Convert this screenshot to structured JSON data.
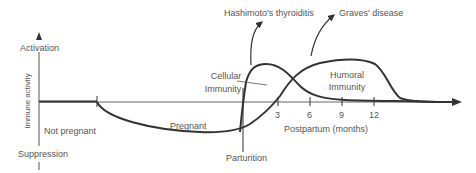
{
  "diagram": {
    "y_axis": {
      "label": "Immune activity",
      "top_label": "Activation",
      "bottom_label": "Suppression"
    },
    "x_axis": {
      "label": "Postpartum (months)",
      "ticks": [
        "3",
        "6",
        "9",
        "12"
      ]
    },
    "phases": {
      "not_pregnant": "Not pregnant",
      "pregnant": "Pregnant",
      "parturition": "Parturition"
    },
    "curves": {
      "cellular": "Cellular\nImmunity",
      "cellular_line1": "Cellular",
      "cellular_line2": "Immunity",
      "humoral_line1": "Humoral",
      "humoral_line2": "Immunity"
    },
    "annotations": {
      "hashimoto": "Hashimoto's thyroiditis",
      "graves": "Graves' disease"
    },
    "colors": {
      "line": "#333333",
      "axis": "#555555",
      "text": "#555555"
    }
  }
}
